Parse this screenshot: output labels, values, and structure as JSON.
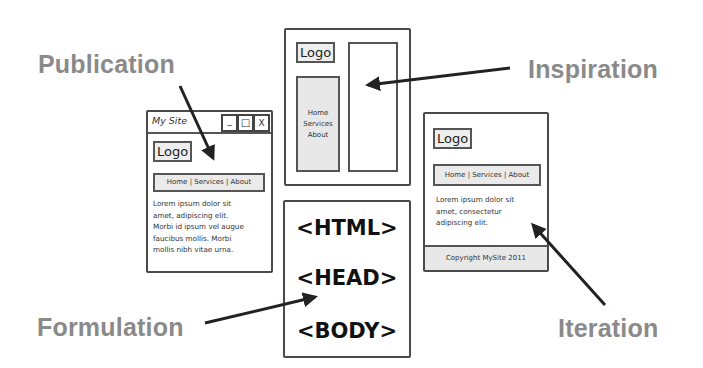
{
  "labels": {
    "publication": "Publication",
    "inspiration": "Inspiration",
    "formulation": "Formulation",
    "iteration": "Iteration"
  },
  "publication_window": {
    "title": "My Site",
    "controls": [
      "_",
      "□",
      "X"
    ],
    "logo": "Logo",
    "nav": "Home | Services | About",
    "body_lines": [
      "Lorem ipsum dolor sit",
      "amet, adipiscing elit.",
      "Morbi id ipsum vel augue",
      "faucibus mollis. Morbi",
      "mollis nibh vitae urna."
    ]
  },
  "inspiration_wireframe": {
    "logo": "Logo",
    "sidebar_items": [
      "Home",
      "Services",
      "About"
    ]
  },
  "formulation_box": {
    "tags": [
      "<HTML>",
      "<HEAD>",
      "<BODY>"
    ]
  },
  "iteration_wireframe": {
    "logo": "Logo",
    "nav": "Home | Services | About",
    "body_lines": [
      "Lorem ipsum dolor sit",
      "amet, consectetur",
      "adipiscing elit."
    ],
    "footer": "Copyright MySite 2011"
  },
  "colors": {
    "label_gray": "#8a8a8a",
    "line": "#333333",
    "fill_gray": "#e8e8e8"
  }
}
